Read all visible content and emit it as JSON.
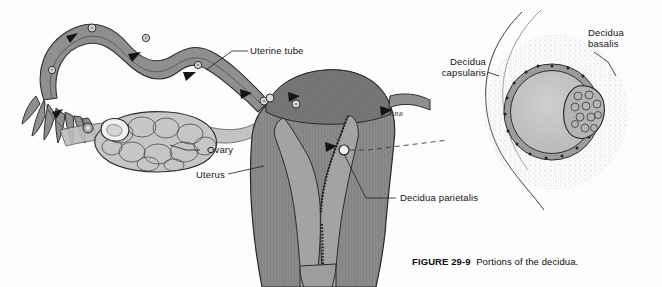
{
  "figure": {
    "caption_number": "FIGURE 29-9",
    "caption_text": "Portions of the decidua.",
    "artist_signature": "NBR"
  },
  "labels": {
    "uterine_tube": "Uterine tube",
    "ovary": "Ovary",
    "uterus": "Uterus",
    "decidua_parietalis": "Decidua parietalis",
    "decidua_capsularis": "Decidua\ncapsularis",
    "decidua_basalis": "Decidua\nbasalis"
  },
  "colors": {
    "tissue_mid": "#8f8f8f",
    "tissue_dark": "#6e6e6e",
    "tissue_light": "#c9c9c9",
    "lumen": "#a8a8a8",
    "outline": "#2b2b2b",
    "background": "#fdfdfd",
    "sac_fill": "#c2c2c2",
    "stipple": "#7a7a7a"
  },
  "diagram": {
    "main_view": "coronal-section-uterus-tubes-ovary",
    "inset_view": "implantation-site-decidua-detail",
    "connector": "dashed-leader-line"
  }
}
